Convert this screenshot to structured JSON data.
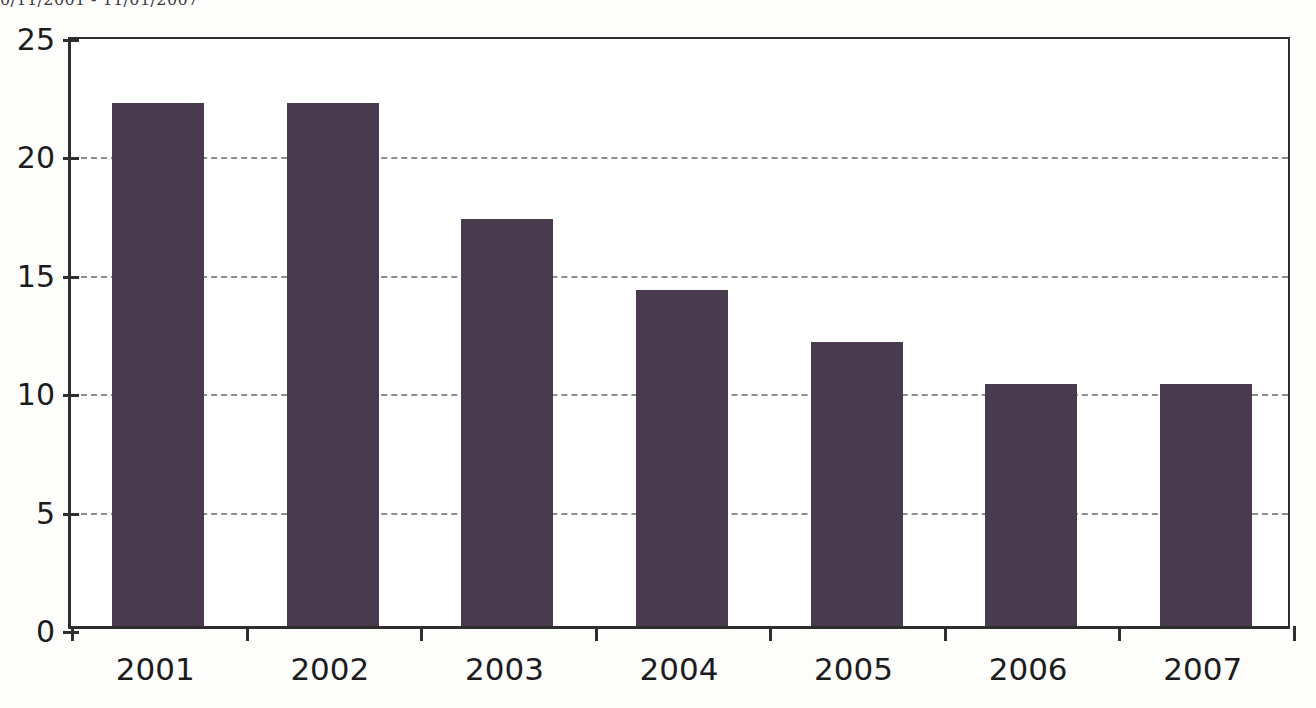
{
  "caption": {
    "text": "0/11/2001 - 11/01/2007"
  },
  "chart_data": {
    "type": "bar",
    "title": "",
    "subtitle": "",
    "xlabel": "",
    "ylabel": "",
    "categories": [
      "2001",
      "2002",
      "2003",
      "2004",
      "2005",
      "2006",
      "2007"
    ],
    "values": [
      22.1,
      22.1,
      17.2,
      14.2,
      12.0,
      10.2,
      10.2
    ],
    "series": [
      {
        "name": "",
        "values": [
          22.1,
          22.1,
          17.2,
          14.2,
          12.0,
          10.2,
          10.2
        ]
      }
    ],
    "ylim": [
      0,
      25
    ],
    "yticks": [
      0,
      5,
      10,
      15,
      20,
      25
    ],
    "ytick_labels": [
      "0",
      "5",
      "10",
      "15",
      "20",
      "25"
    ],
    "gridlines": [
      5,
      10,
      15,
      20
    ],
    "grid": true,
    "grid_style": "dashed-horizontal",
    "legend": false,
    "legend_position": "none",
    "bar_color": "#4a3a4d",
    "axis_color": "#2e2e2e",
    "grid_color": "#8d8d8d",
    "background_color": "#ffffff"
  }
}
